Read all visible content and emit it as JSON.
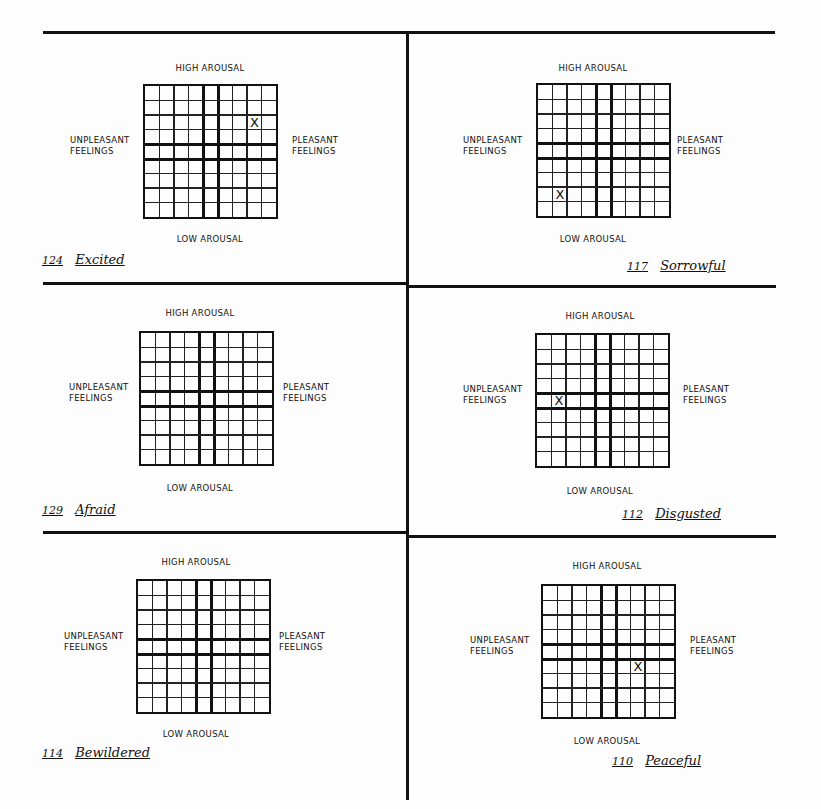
{
  "form": {
    "axis_labels": {
      "top": "HIGH AROUSAL",
      "bottom": "LOW AROUSAL",
      "left_line1": "UNPLEASANT",
      "left_line2": "FEELINGS",
      "right_line1": "PLEASANT",
      "right_line2": "FEELINGS"
    },
    "grid": {
      "columns": 9,
      "rows": 9,
      "thick_columns_bracket": 5,
      "thick_rows_bracket": 5
    },
    "panels": [
      {
        "id": "excited",
        "number": "124",
        "word": "Excited",
        "mark": "X",
        "mark_col": 8,
        "mark_row": 3
      },
      {
        "id": "sorrowful",
        "number": "117",
        "word": "Sorrowful",
        "mark": "X",
        "mark_col": 2,
        "mark_row": 8
      },
      {
        "id": "afraid",
        "number": "129",
        "word": "Afraid",
        "mark": "",
        "mark_col": null,
        "mark_row": null
      },
      {
        "id": "disgusted",
        "number": "112",
        "word": "Disgusted",
        "mark": "X",
        "mark_col": 2,
        "mark_row": 5
      },
      {
        "id": "bewildered",
        "number": "114",
        "word": "Bewildered",
        "mark": "",
        "mark_col": null,
        "mark_row": null
      },
      {
        "id": "peaceful",
        "number": "110",
        "word": "Peaceful",
        "mark": "X",
        "mark_col": 7,
        "mark_row": 6
      }
    ]
  }
}
